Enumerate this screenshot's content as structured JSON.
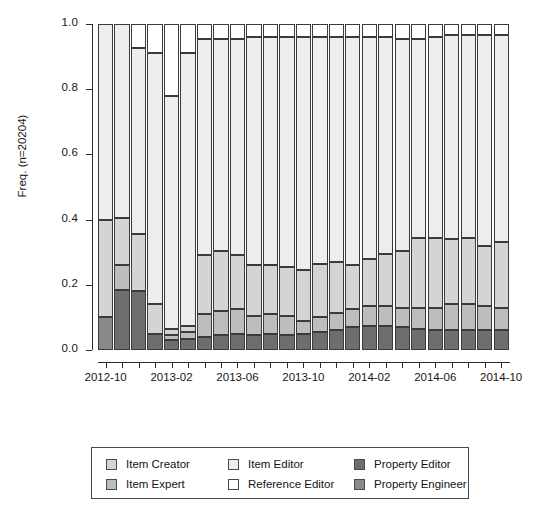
{
  "chart_data": {
    "type": "bar",
    "subtype": "stacked-proportional-spineplot",
    "title": "",
    "xlabel": "",
    "ylabel": "Freq. (n=20204)",
    "ylim": [
      0.0,
      1.0
    ],
    "ytick_labels": [
      "0.0",
      "0.2",
      "0.4",
      "0.6",
      "0.8",
      "1.0"
    ],
    "ytick_values": [
      0.0,
      0.2,
      0.4,
      0.6,
      0.8,
      1.0
    ],
    "grid": false,
    "legend_position": "bottom",
    "n": 20204,
    "categories": [
      "2012-10",
      "2012-11",
      "2012-12",
      "2013-01",
      "2013-02",
      "2013-03",
      "2013-04",
      "2013-05",
      "2013-06",
      "2013-07",
      "2013-08",
      "2013-09",
      "2013-10",
      "2013-11",
      "2013-12",
      "2014-01",
      "2014-02",
      "2014-03",
      "2014-04",
      "2014-05",
      "2014-06",
      "2014-07",
      "2014-08",
      "2014-09",
      "2014-10"
    ],
    "xtick_labels": [
      "2012-10",
      "2013-02",
      "2013-06",
      "2013-10",
      "2014-02",
      "2014-06",
      "2014-10"
    ],
    "xtick_label_indices": [
      0,
      4,
      8,
      12,
      16,
      20,
      24
    ],
    "series": [
      {
        "name": "Property Engineer",
        "color": "#8a8a8a",
        "values": [
          0.1,
          0.0,
          0.0,
          0.0,
          0.0,
          0.0,
          0.0,
          0.0,
          0.0,
          0.0,
          0.0,
          0.0,
          0.0,
          0.0,
          0.0,
          0.0,
          0.0,
          0.0,
          0.0,
          0.0,
          0.0,
          0.0,
          0.0,
          0.0,
          0.0
        ]
      },
      {
        "name": "Property Editor",
        "color": "#6e6e6e",
        "values": [
          0.0,
          0.185,
          0.18,
          0.05,
          0.03,
          0.035,
          0.04,
          0.045,
          0.05,
          0.045,
          0.05,
          0.045,
          0.05,
          0.055,
          0.06,
          0.07,
          0.075,
          0.075,
          0.07,
          0.065,
          0.06,
          0.06,
          0.06,
          0.06,
          0.06
        ]
      },
      {
        "name": "Item Expert",
        "color": "#bdbdbd",
        "values": [
          0.0,
          0.075,
          0.0,
          0.0,
          0.015,
          0.02,
          0.07,
          0.075,
          0.075,
          0.06,
          0.06,
          0.06,
          0.04,
          0.045,
          0.055,
          0.055,
          0.06,
          0.06,
          0.06,
          0.065,
          0.07,
          0.08,
          0.08,
          0.075,
          0.07
        ]
      },
      {
        "name": "Item Creator",
        "color": "#d4d4d4",
        "values": [
          0.3,
          0.145,
          0.175,
          0.09,
          0.02,
          0.02,
          0.18,
          0.185,
          0.165,
          0.155,
          0.15,
          0.15,
          0.155,
          0.165,
          0.155,
          0.135,
          0.145,
          0.16,
          0.175,
          0.215,
          0.215,
          0.2,
          0.205,
          0.185,
          0.2
        ]
      },
      {
        "name": "Item Editor",
        "color": "#ededed",
        "values": [
          0.6,
          0.595,
          0.57,
          0.77,
          0.715,
          0.835,
          0.665,
          0.65,
          0.665,
          0.7,
          0.7,
          0.705,
          0.715,
          0.695,
          0.69,
          0.7,
          0.68,
          0.665,
          0.65,
          0.61,
          0.615,
          0.625,
          0.62,
          0.645,
          0.635
        ]
      },
      {
        "name": "Reference Editor",
        "color": "#ffffff",
        "values": [
          0.0,
          0.0,
          0.075,
          0.09,
          0.22,
          0.09,
          0.045,
          0.045,
          0.045,
          0.04,
          0.04,
          0.04,
          0.04,
          0.04,
          0.04,
          0.04,
          0.04,
          0.04,
          0.045,
          0.045,
          0.04,
          0.035,
          0.035,
          0.035,
          0.035
        ]
      }
    ],
    "stack_order_bottom_to_top": [
      "Property Engineer",
      "Property Editor",
      "Item Expert",
      "Item Creator",
      "Item Editor",
      "Reference Editor"
    ]
  },
  "legend": {
    "columns": [
      {
        "entries": [
          {
            "label": "Item Creator",
            "color": "#d4d4d4"
          },
          {
            "label": "Item Expert",
            "color": "#bdbdbd"
          }
        ]
      },
      {
        "entries": [
          {
            "label": "Item Editor",
            "color": "#ededed"
          },
          {
            "label": "Reference Editor",
            "color": "#ffffff"
          }
        ]
      },
      {
        "entries": [
          {
            "label": "Property Editor",
            "color": "#6e6e6e"
          },
          {
            "label": "Property Engineer",
            "color": "#8a8a8a"
          }
        ]
      }
    ]
  },
  "colors": {
    "axis": "#2b2b2b",
    "segment_border": "#3b3b3b",
    "background": "#ffffff",
    "text": "#161616"
  }
}
